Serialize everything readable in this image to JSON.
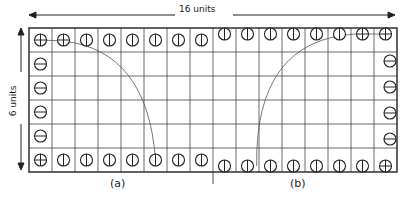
{
  "diagram": {
    "width_label": "16 units",
    "height_label": "6 units",
    "subfigures": [
      {
        "id": "a",
        "label": "(a)"
      },
      {
        "id": "b",
        "label": "(b)"
      }
    ],
    "grid": {
      "columns": 16,
      "rows": 6,
      "left": 29,
      "top": 28,
      "cell_w": 23,
      "cell_h": 24
    },
    "colors": {
      "line": "#222222",
      "grid": "#444444",
      "arc": "#555555",
      "background": "#ffffff"
    }
  }
}
